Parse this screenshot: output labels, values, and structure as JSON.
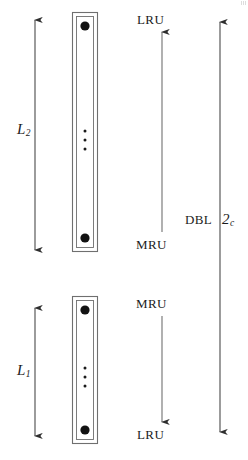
{
  "figure": {
    "width": 248,
    "height": 460,
    "background_color": "#ffffff",
    "stroke_color": "#3a3a3a",
    "text_color": "#1b1b1b",
    "dot_color": "#111111"
  },
  "labels": {
    "lru_top": "LRU",
    "mru_middle": "MRU",
    "mru_lower": "MRU",
    "lru_bottom": "LRU",
    "dbl": "DBL",
    "two_c_base": "2",
    "two_c_sub": "c",
    "l2_base": "L",
    "l2_sub": "2",
    "l1_base": "L",
    "l1_sub": "1"
  },
  "diagram_elements": {
    "lists": [
      {
        "name": "upper-list",
        "label": "L2",
        "box": {
          "x": 72,
          "y": 12,
          "width": 26,
          "height": 240
        },
        "head_dot": "filled-circle-top",
        "tail_dot": "filled-circle-bottom",
        "ellipsis": "vertical-three-dots",
        "head_end": "LRU",
        "tail_end": "MRU"
      },
      {
        "name": "lower-list",
        "label": "L1",
        "box": {
          "x": 72,
          "y": 296,
          "width": 26,
          "height": 148
        },
        "head_dot": "filled-circle-top",
        "tail_dot": "filled-circle-bottom",
        "ellipsis": "vertical-three-dots",
        "head_end": "MRU",
        "tail_end": "LRU"
      }
    ],
    "arrows": [
      {
        "name": "l2-extent-arrow",
        "type": "double-headed",
        "orientation": "vertical",
        "x": 35,
        "y1": 20,
        "y2": 250
      },
      {
        "name": "l1-extent-arrow",
        "type": "double-headed",
        "orientation": "vertical",
        "x": 35,
        "y1": 308,
        "y2": 436
      },
      {
        "name": "upper-recency-arrow",
        "type": "single-headed-up",
        "orientation": "vertical",
        "x": 162,
        "y1": 232,
        "y2": 32
      },
      {
        "name": "lower-recency-arrow",
        "type": "single-headed-down",
        "orientation": "vertical",
        "x": 162,
        "y1": 316,
        "y2": 422
      },
      {
        "name": "dbl-extent-arrow",
        "type": "double-headed",
        "orientation": "vertical",
        "x": 220,
        "y1": 22,
        "y2": 432
      }
    ]
  }
}
